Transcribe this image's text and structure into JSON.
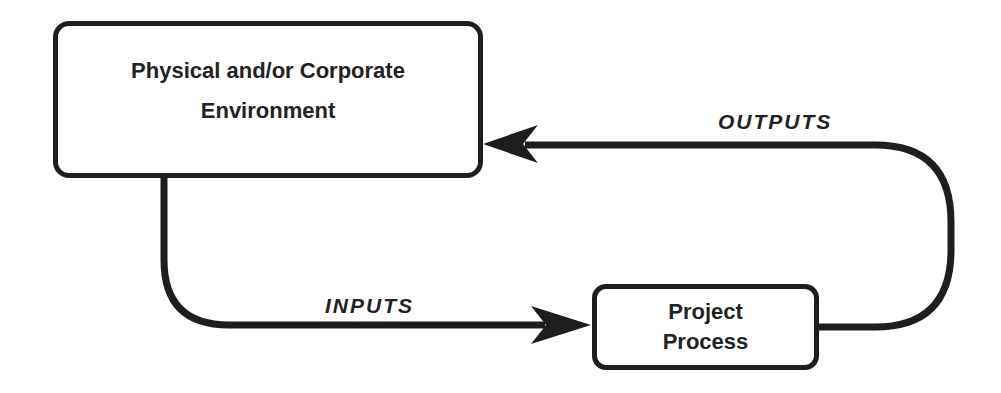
{
  "diagram": {
    "type": "flow-loop",
    "colors": {
      "stroke": "#1e1e1e",
      "text": "#222222",
      "background": "#ffffff"
    },
    "nodes": {
      "environment": {
        "line1": "Physical and/or Corporate",
        "line2": "Environment"
      },
      "process": {
        "line1": "Project",
        "line2": "Process"
      }
    },
    "edges": {
      "inputs": {
        "label": "INPUTS",
        "from": "Physical and/or Corporate Environment",
        "to": "Project Process"
      },
      "outputs": {
        "label": "OUTPUTS",
        "from": "Project Process",
        "to": "Physical and/or Corporate Environment"
      }
    }
  }
}
